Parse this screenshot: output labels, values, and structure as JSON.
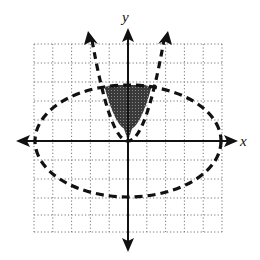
{
  "graph": {
    "x_axis_label": "x",
    "y_axis_label": "y",
    "grid": {
      "x_min": -5,
      "x_max": 5,
      "y_min": -5,
      "y_max": 5,
      "step": 1
    },
    "ellipse": {
      "cx": 0,
      "cy": 0,
      "rx": 5,
      "ry": 3,
      "style": "dashed"
    },
    "parabola": {
      "equation": "y = x^2",
      "vertex": [
        0,
        0
      ],
      "style": "dashed"
    },
    "shaded_region": "inside parabola and inside ellipse",
    "colors": {
      "curve": "#111111",
      "shade": "#555555",
      "grid": "#777777"
    }
  }
}
